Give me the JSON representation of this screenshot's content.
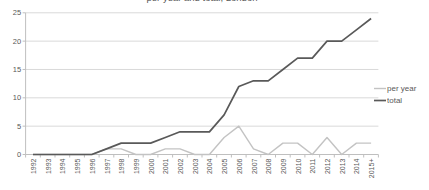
{
  "chart_data": {
    "type": "line",
    "title": "per year and total, London",
    "categories": [
      "1992",
      "1993",
      "1994",
      "1995",
      "1996",
      "1997",
      "1998",
      "1999",
      "2000",
      "2001",
      "2002",
      "2003",
      "2004",
      "2005",
      "2006",
      "2007",
      "2008",
      "2009",
      "2010",
      "2011",
      "2012",
      "2013",
      "2014",
      "2015+"
    ],
    "series": [
      {
        "name": "per year",
        "color": "#c3c3c3",
        "values": [
          0,
          0,
          0,
          0,
          0,
          1,
          1,
          0,
          0,
          1,
          1,
          0,
          0,
          3,
          5,
          1,
          0,
          2,
          2,
          0,
          3,
          0,
          2,
          2
        ]
      },
      {
        "name": "total",
        "color": "#595959",
        "values": [
          0,
          0,
          0,
          0,
          0,
          1,
          2,
          2,
          2,
          3,
          4,
          4,
          4,
          7,
          12,
          13,
          13,
          15,
          17,
          17,
          20,
          20,
          22,
          24
        ]
      }
    ],
    "ylim": [
      0,
      25
    ],
    "yticks": [
      0,
      5,
      10,
      15,
      20,
      25
    ],
    "grid": true,
    "legend_position": "right",
    "colors": {
      "gridline": "#d9d9d9",
      "axis": "#bfbfbf",
      "tick_label": "#595959",
      "legend_text": "#595959"
    }
  }
}
